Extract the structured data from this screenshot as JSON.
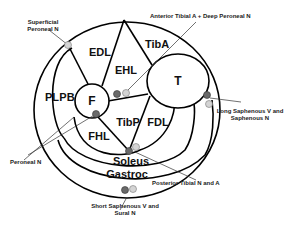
{
  "diagram": {
    "bones": {
      "fibula": "F",
      "tibia": "T"
    },
    "muscles": {
      "edl": "EDL",
      "ehl": "EHL",
      "tiba": "TibA",
      "pl": "PL",
      "pb": "PB",
      "fhl": "FHL",
      "tibp": "TibP",
      "fdl": "FDL",
      "soleus": "Soleus",
      "gastroc": "Gastroc"
    },
    "callouts": {
      "superficial_peroneal_1": "Superficial",
      "superficial_peroneal_2": "Peroneal N",
      "anterior_tibial": "Anterior Tibial A + Deep Peroneal N",
      "long_saphenous_1": "Long Saphenous V and",
      "long_saphenous_2": "Saphenous N",
      "peroneal": "Peroneal N",
      "posterior_tibial": "Posterior Tibial N and A",
      "short_saphenous_1": "Short Saphenous V and",
      "short_saphenous_2": "Sural N"
    },
    "colors": {
      "line": "#000000",
      "dark_dot": "#6a6a6a",
      "light_dot": "#d4d4d4",
      "background": "#ffffff"
    }
  }
}
